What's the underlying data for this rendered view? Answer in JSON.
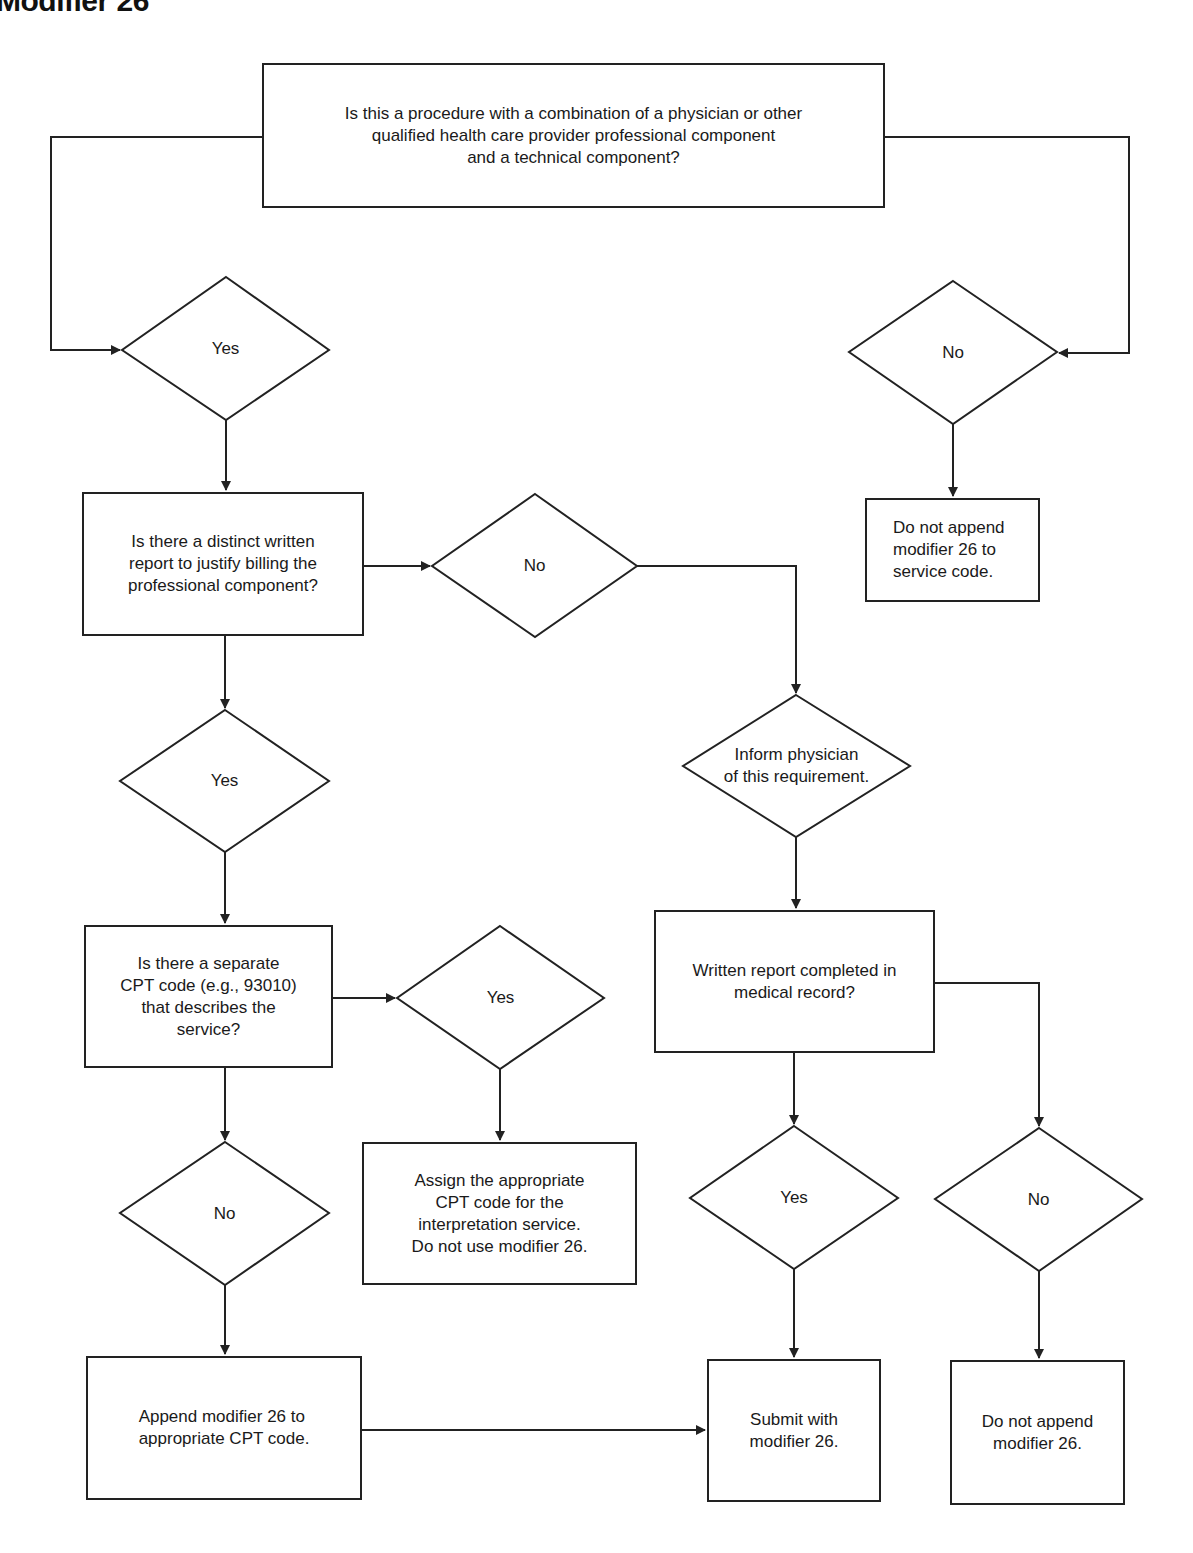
{
  "title": "Modifier 26",
  "nodes": {
    "start": {
      "type": "process",
      "text": "Is this a procedure with a combination of a physician or other\nqualified health care provider professional component\nand a technical component?"
    },
    "d_yes_1": {
      "type": "decision",
      "text": "Yes"
    },
    "d_no_1": {
      "type": "decision",
      "text": "No"
    },
    "end_no_service": {
      "type": "process",
      "text": "Do not append\nmodifier 26 to\nservice code."
    },
    "q_report": {
      "type": "process",
      "text": "Is there a distinct written\nreport to justify billing the\nprofessional component?"
    },
    "d_no_2": {
      "type": "decision",
      "text": "No"
    },
    "d_inform": {
      "type": "decision",
      "text": "Inform physician\nof this requirement."
    },
    "d_yes_2": {
      "type": "decision",
      "text": "Yes"
    },
    "q_cpt": {
      "type": "process",
      "text": "Is there a separate\nCPT code (e.g., 93010)\nthat describes the\nservice?"
    },
    "d_yes_3": {
      "type": "decision",
      "text": "Yes"
    },
    "q_written": {
      "type": "process",
      "text": "Written report completed in\nmedical record?"
    },
    "d_no_3": {
      "type": "decision",
      "text": "No"
    },
    "end_assign": {
      "type": "process",
      "text": "Assign the appropriate\nCPT code for the\ninterpretation service.\nDo not use modifier 26."
    },
    "d_yes_4": {
      "type": "decision",
      "text": "Yes"
    },
    "d_no_4": {
      "type": "decision",
      "text": "No"
    },
    "end_append": {
      "type": "process",
      "text": "Append modifier 26 to\nappropriate CPT code."
    },
    "end_submit": {
      "type": "process",
      "text": "Submit with\nmodifier 26."
    },
    "end_no_append": {
      "type": "process",
      "text": "Do not append\nmodifier 26."
    }
  },
  "edges": [
    [
      "start",
      "d_yes_1"
    ],
    [
      "start",
      "d_no_1"
    ],
    [
      "d_no_1",
      "end_no_service"
    ],
    [
      "d_yes_1",
      "q_report"
    ],
    [
      "q_report",
      "d_no_2"
    ],
    [
      "q_report",
      "d_yes_2"
    ],
    [
      "d_no_2",
      "d_inform"
    ],
    [
      "d_inform",
      "q_written"
    ],
    [
      "d_yes_2",
      "q_cpt"
    ],
    [
      "q_cpt",
      "d_yes_3"
    ],
    [
      "q_cpt",
      "d_no_3"
    ],
    [
      "d_yes_3",
      "end_assign"
    ],
    [
      "d_no_3",
      "end_append"
    ],
    [
      "end_append",
      "end_submit"
    ],
    [
      "q_written",
      "d_yes_4"
    ],
    [
      "q_written",
      "d_no_4"
    ],
    [
      "d_yes_4",
      "end_submit"
    ],
    [
      "d_no_4",
      "end_no_append"
    ]
  ],
  "colors": {
    "stroke": "#222222",
    "background": "#ffffff",
    "text": "#1a1a1a"
  }
}
